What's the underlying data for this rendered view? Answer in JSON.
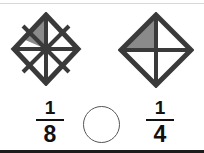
{
  "worksheet": {
    "type": "fraction-comparison",
    "palette": {
      "line": "#3a3a3a",
      "shade": "#8a8a8a",
      "text": "#111111",
      "background": "#ffffff",
      "circle_stroke": "#555555",
      "bottom_border": "#1c1c1c"
    },
    "left_figure": {
      "label": "diamond-divided-into-eighths",
      "shape": "diamond",
      "total_parts": 8,
      "shaded_parts": 1,
      "shaded_region": "upper-left-inner-triangle"
    },
    "right_figure": {
      "label": "diamond-divided-into-fourths",
      "shape": "diamond",
      "total_parts": 4,
      "shaded_parts": 1,
      "shaded_region": "upper-left-quadrant"
    },
    "left_fraction": {
      "numerator": "1",
      "denominator": "8"
    },
    "right_fraction": {
      "numerator": "1",
      "denominator": "4"
    },
    "comparison": {
      "answer": ""
    }
  }
}
